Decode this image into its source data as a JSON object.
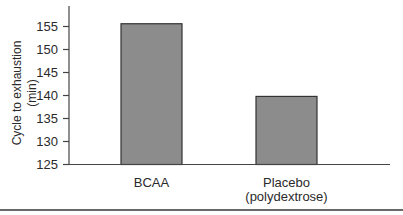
{
  "chart_data": {
    "type": "bar",
    "title": "",
    "xlabel": "",
    "ylabel": "Cycle to exhaustion (min)",
    "ylabel_lines": [
      "Cycle to exhaustion",
      "(min)"
    ],
    "categories": [
      "BCAA",
      "Placebo (polydextrose)"
    ],
    "category_lines": [
      [
        "BCAA"
      ],
      [
        "Placebo",
        "(polydextrose)"
      ]
    ],
    "values": [
      155.6,
      139.8
    ],
    "ylim": [
      125,
      158
    ],
    "yticks": [
      125,
      130,
      135,
      140,
      145,
      150,
      155
    ],
    "grid": false,
    "legend": null,
    "bar_color": "#8c8c8c",
    "bar_edge_color": "#333333"
  }
}
